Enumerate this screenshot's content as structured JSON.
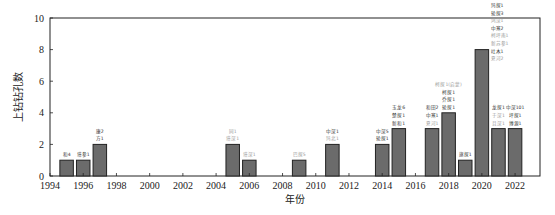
{
  "chart_data": {
    "type": "bar",
    "title": "",
    "xlabel": "年份",
    "ylabel": "上钻钻孔数",
    "xlim": [
      1994,
      2023.5
    ],
    "ylim": [
      0,
      10
    ],
    "xticks": [
      1994,
      1996,
      1998,
      2000,
      2002,
      2004,
      2006,
      2008,
      2010,
      2012,
      2014,
      2016,
      2018,
      2020,
      2022
    ],
    "yticks": [
      0,
      2,
      4,
      6,
      8,
      10
    ],
    "grid": false,
    "legend": null,
    "categories": [
      1995,
      1996,
      1997,
      2005,
      2006,
      2009,
      2011,
      2014,
      2015,
      2017,
      2018,
      2019,
      2020,
      2021,
      2022
    ],
    "values": [
      1,
      1,
      2,
      2,
      1,
      1,
      2,
      2,
      3,
      3,
      4,
      1,
      8,
      3,
      3
    ],
    "annotations": [
      {
        "year": 1995,
        "lines": [
          {
            "text": "和4",
            "tone": "dark"
          }
        ]
      },
      {
        "year": 1996,
        "lines": [
          {
            "text": "塔参1",
            "tone": "dark"
          }
        ]
      },
      {
        "year": 1997,
        "lines": [
          {
            "text": "康2",
            "tone": "dark"
          },
          {
            "text": "方1",
            "tone": "dark"
          }
        ]
      },
      {
        "year": 2005,
        "lines": [
          {
            "text": "同1",
            "tone": "light"
          },
          {
            "text": "塔深1",
            "tone": "light"
          }
        ]
      },
      {
        "year": 2006,
        "lines": [
          {
            "text": "塔深1",
            "tone": "light"
          }
        ]
      },
      {
        "year": 2009,
        "lines": [
          {
            "text": "巴探5",
            "tone": "light"
          }
        ]
      },
      {
        "year": 2011,
        "lines": [
          {
            "text": "中深1",
            "tone": "dark"
          },
          {
            "text": "玛北1",
            "tone": "light"
          }
        ]
      },
      {
        "year": 2014,
        "lines": [
          {
            "text": "中深5",
            "tone": "dark"
          },
          {
            "text": "轮探1",
            "tone": "dark"
          }
        ]
      },
      {
        "year": 2015,
        "lines": [
          {
            "text": "玉龙6",
            "tone": "dark"
          },
          {
            "text": "楚探1",
            "tone": "dark"
          },
          {
            "text": "新和1",
            "tone": "dark"
          }
        ]
      },
      {
        "year": 2017,
        "lines": [
          {
            "text": "和田2",
            "tone": "dark"
          },
          {
            "text": "中寒1",
            "tone": "dark"
          },
          {
            "text": "夏河1",
            "tone": "light"
          }
        ]
      },
      {
        "year": 2018,
        "lines": [
          {
            "text": "柯探1(启蒙)",
            "tone": "light"
          },
          {
            "text": "柯探1",
            "tone": "dark"
          },
          {
            "text": "乔探1",
            "tone": "dark"
          },
          {
            "text": "轮探1",
            "tone": "dark"
          }
        ]
      },
      {
        "year": 2019,
        "lines": [
          {
            "text": "旗探1",
            "tone": "dark"
          }
        ]
      },
      {
        "year": 2020,
        "lines": [
          {
            "text": "玛探1",
            "tone": "dark"
          },
          {
            "text": "轮探3",
            "tone": "dark"
          },
          {
            "text": "鸿深1",
            "tone": "light"
          },
          {
            "text": "中寒2",
            "tone": "dark"
          },
          {
            "text": "柯坪南1",
            "tone": "light"
          },
          {
            "text": "新苏参1",
            "tone": "light"
          },
          {
            "text": "吐木1",
            "tone": "dark"
          },
          {
            "text": "夏河2",
            "tone": "light"
          }
        ]
      },
      {
        "year": 2021,
        "lines": [
          {
            "text": "龙探1",
            "tone": "dark"
          },
          {
            "text": "于深1",
            "tone": "light"
          },
          {
            "text": "且深1",
            "tone": "light"
          }
        ]
      },
      {
        "year": 2022,
        "lines": [
          {
            "text": "中深101",
            "tone": "dark"
          },
          {
            "text": "坪探1",
            "tone": "dark"
          },
          {
            "text": "博源1",
            "tone": "dark"
          }
        ]
      }
    ]
  },
  "colors": {
    "bar_fill": "#6b6b6b",
    "bar_stroke": "#222222",
    "annotation_dark": "#333333",
    "annotation_light": "#9a9a9a"
  }
}
